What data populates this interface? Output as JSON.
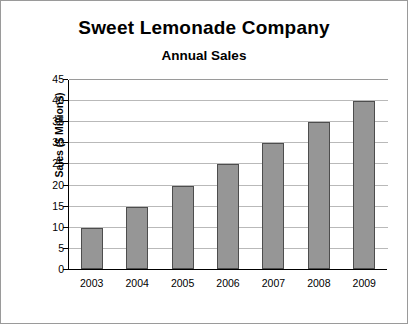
{
  "chart_data": {
    "type": "bar",
    "title": "Sweet Lemonade Company",
    "subtitle": "Annual Sales",
    "xlabel": "",
    "ylabel": "Sales ($ Millions)",
    "categories": [
      "2003",
      "2004",
      "2005",
      "2006",
      "2007",
      "2008",
      "2009"
    ],
    "values": [
      10,
      15,
      20,
      25,
      30,
      35,
      40
    ],
    "ylim": [
      0,
      45
    ],
    "yticks": [
      0,
      5,
      10,
      15,
      20,
      25,
      30,
      35,
      40,
      45
    ],
    "ytick_labels": [
      "0",
      "5",
      "10",
      "15",
      "20",
      "25",
      "30",
      "35",
      "40",
      "45"
    ],
    "grid": true,
    "legend": false,
    "series": [
      {
        "name": "Annual Sales",
        "values": [
          10,
          15,
          20,
          25,
          30,
          35,
          40
        ],
        "bar_fill": "#969696",
        "bar_border": "#4d4d4d"
      }
    ],
    "colors": {
      "background": "#ffffff",
      "axis": "#000000",
      "gridline": "#b9b9b9",
      "text": "#000000",
      "border": "#9a9a9a"
    }
  }
}
